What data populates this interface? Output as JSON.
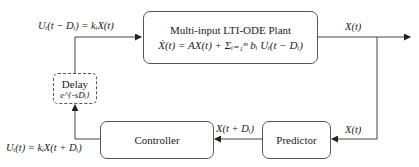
{
  "diagram": {
    "plant": {
      "title": "Multi-input LTI-ODE Plant",
      "equation": "Ẋ(t) = AX(t) + Σᵢ₌₁ᵐ bᵢ Uᵢ(t − Dᵢ)"
    },
    "delay": {
      "title": "Delay",
      "transfer": "e^{-sDᵢ}"
    },
    "controller": {
      "title": "Controller"
    },
    "predictor": {
      "title": "Predictor"
    },
    "labels": {
      "delayed_input": "Uᵢ(t − Dᵢ) = kᵢX(t)",
      "plant_output": "X(t)",
      "predictor_input": "X(t)",
      "predicted_state": "X(t + Dᵢ)",
      "control_law": "Uᵢ(t) = kᵢX(t + Dᵢ)"
    },
    "colors": {
      "line": "#444444",
      "box_border": "#555555"
    }
  }
}
